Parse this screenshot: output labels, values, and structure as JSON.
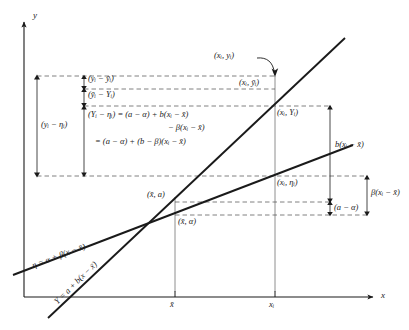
{
  "figure": {
    "type": "regression-decomposition-diagram",
    "axes": {
      "y_label": "y",
      "x_label": "x",
      "x_ticks": [
        "x̄",
        "xᵢ"
      ]
    },
    "lines": [
      {
        "name": "true-regression-line",
        "equation": "η = α + β(x − x̄)",
        "symbol": "eta"
      },
      {
        "name": "fitted-regression-line",
        "equation": "Y = a + b(x − x̄)",
        "symbol": "Y"
      }
    ],
    "point_labels": [
      {
        "name": "observed-point",
        "text": "(xᵢ, yᵢ)"
      },
      {
        "name": "mean-response-point",
        "text": "(xᵢ, ȳᵢ)"
      },
      {
        "name": "fitted-point",
        "text": "(xᵢ, Yᵢ)"
      },
      {
        "name": "true-mean-point",
        "text": "(xᵢ, ηᵢ)"
      },
      {
        "name": "fitted-at-xbar-point",
        "text": "(x̄, a)"
      },
      {
        "name": "true-at-xbar-point",
        "text": "(x̄, α)"
      }
    ],
    "brackets": [
      {
        "name": "total-deviation",
        "text": "(yᵢ − ηᵢ)"
      },
      {
        "name": "within-deviation",
        "text": "(yᵢ − ȳᵢ)"
      },
      {
        "name": "lack-of-fit-deviation",
        "text": "(ȳᵢ − Yᵢ)"
      },
      {
        "name": "fitted-slope-term",
        "text": "b(xᵢ − x̄)"
      },
      {
        "name": "true-slope-term",
        "text": "β(xᵢ − x̄)"
      },
      {
        "name": "intercept-difference",
        "text": "(a − α)"
      }
    ],
    "equation_block": {
      "name": "decomposition-equation",
      "line1": "(Yᵢ − ηᵢ) = (a − α) + b(xᵢ − x̄)",
      "line2": "− β(xᵢ − x̄)",
      "line3": "= (a − α) + (b − β)(xᵢ − x̄)"
    },
    "colors": {
      "ink": "#1a1a1a",
      "dash": "#555555",
      "thin": "#666666",
      "background": "#ffffff"
    }
  }
}
